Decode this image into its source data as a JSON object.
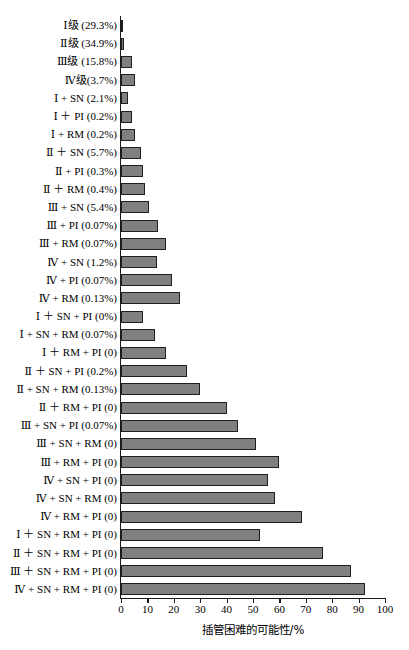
{
  "chart_data": {
    "type": "bar",
    "orientation": "horizontal",
    "title": "",
    "xlabel": "插管困难的可能性/%",
    "ylabel": "",
    "xlim": [
      0,
      100
    ],
    "xticks": [
      0,
      10,
      20,
      30,
      40,
      50,
      60,
      70,
      80,
      90,
      100
    ],
    "xtick_labels": [
      "0",
      "10",
      "20",
      "30",
      "40",
      "50",
      "60",
      "70",
      "80",
      "90",
      "100"
    ],
    "grid": false,
    "legend": false,
    "bar_color": "#808080",
    "bar_edge_color": "#1f1f1f",
    "axis_color": "#1a1a1a",
    "categories": [
      "Ⅰ级 (29.3%)",
      "Ⅱ级 (34.9%)",
      "Ⅲ级 (15.8%)",
      "Ⅳ级(3.7%)",
      "Ⅰ + SN (2.1%)",
      "Ⅰ ＋ PI (0.2%)",
      "Ⅰ + RM (0.2%)",
      "Ⅱ ＋ SN (5.7%)",
      "Ⅱ + PI (0.3%)",
      "Ⅱ ＋ RM (0.4%)",
      "Ⅲ + SN (5.4%)",
      "Ⅲ + PI (0.07%)",
      "Ⅲ + RM (0.07%)",
      "Ⅳ + SN (1.2%)",
      "Ⅳ + PI (0.07%)",
      "Ⅳ + RM (0.13%)",
      "Ⅰ ＋ SN + PI (0%)",
      "Ⅰ + SN + RM (0.07%)",
      "Ⅰ ＋ RM + PI (0)",
      "Ⅱ ＋ SN + PI (0.2%)",
      "Ⅱ + SN + RM (0.13%)",
      "Ⅱ ＋ RM + PI (0)",
      "Ⅲ + SN + PI (0.07%)",
      "Ⅲ + SN + RM (0)",
      "Ⅲ + RM + PI (0)",
      "Ⅳ + SN + PI (0)",
      "Ⅳ + SN + RM (0)",
      "Ⅳ + RM + PI (0)",
      "Ⅰ ＋ SN + RM + PI (0)",
      "Ⅱ ＋ SN + RM + PI (0)",
      "Ⅲ ＋ SN + RM + PI (0)",
      "Ⅳ + SN + RM + PI (0)"
    ],
    "values": [
      0.8,
      1.2,
      4.0,
      5.2,
      2.6,
      4.0,
      5.4,
      7.6,
      8.2,
      9.2,
      10.5,
      14.0,
      17.0,
      13.5,
      19.5,
      22.5,
      8.5,
      13.0,
      17.0,
      25.0,
      30.0,
      40.0,
      44.5,
      51.0,
      60.0,
      55.5,
      58.5,
      68.5,
      52.5,
      76.5,
      87.0,
      92.5
    ],
    "value_unit": "%",
    "n_bars": 32
  }
}
